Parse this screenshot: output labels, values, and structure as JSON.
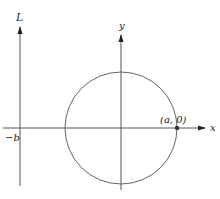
{
  "figure": {
    "labels": {
      "L_axis": "L",
      "y_axis": "y",
      "x_axis": "x",
      "neg_b": "−b",
      "point": "(a, 0)"
    },
    "geometry": {
      "L_axis_x": 20,
      "y_axis_x": 121,
      "x_axis_y": 128,
      "circle_center": [
        121,
        128
      ],
      "circle_radius": 56,
      "point": [
        177,
        128
      ]
    },
    "colors": {
      "axis": "#555555",
      "circle": "#666666",
      "text": "#222222"
    }
  }
}
